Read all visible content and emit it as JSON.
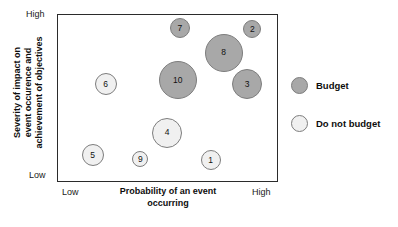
{
  "chart_data": {
    "type": "scatter",
    "title": "",
    "xlabel": "Probability of an event occurring",
    "ylabel": "Severity of impact on event occurence and achievement of objectives",
    "xlabel_lines": [
      "Probability of an event",
      "occurring"
    ],
    "ylabel_lines": [
      "Severity of impact on",
      "event occurence and",
      "achievement of objectives"
    ],
    "x_ticks": [
      "Low",
      "High"
    ],
    "y_ticks": [
      "Low",
      "High"
    ],
    "xlim": [
      "Low",
      "High"
    ],
    "ylim": [
      "Low",
      "High"
    ],
    "grid": false,
    "legend_position": "right",
    "series": [
      {
        "name": "Budget",
        "color": "#a8a8a8",
        "points": [
          {
            "label": "7",
            "x": 0.556,
            "y": 0.921,
            "size": 10.0
          },
          {
            "label": "2",
            "x": 0.887,
            "y": 0.917,
            "size": 9.0
          },
          {
            "label": "8",
            "x": 0.756,
            "y": 0.774,
            "size": 19.0
          },
          {
            "label": "10",
            "x": 0.547,
            "y": 0.607,
            "size": 19.0
          },
          {
            "label": "3",
            "x": 0.864,
            "y": 0.583,
            "size": 15.0
          }
        ]
      },
      {
        "name": "Do not budget",
        "color": "#f0f0f0",
        "points": [
          {
            "label": "6",
            "x": 0.217,
            "y": 0.583,
            "size": 11.0
          },
          {
            "label": "4",
            "x": 0.498,
            "y": 0.292,
            "size": 15.0
          },
          {
            "label": "5",
            "x": 0.158,
            "y": 0.155,
            "size": 11.0
          },
          {
            "label": "9",
            "x": 0.376,
            "y": 0.131,
            "size": 8.0
          },
          {
            "label": "1",
            "x": 0.697,
            "y": 0.125,
            "size": 10.0
          }
        ]
      }
    ],
    "legend": [
      {
        "label": "Budget",
        "color": "#a8a8a8"
      },
      {
        "label": "Do not budget",
        "color": "#f0f0f0"
      }
    ]
  },
  "colors": {
    "budget": "#a8a8a8",
    "do_not_budget": "#f0f0f0",
    "frame": "#2b2b2b",
    "bubble_stroke": "#7d7d7d",
    "background": "#ffffff",
    "text": "#0d0d0d"
  }
}
